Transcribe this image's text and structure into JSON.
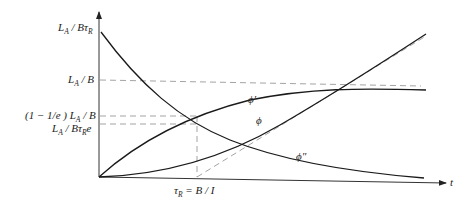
{
  "diagram": {
    "axes": {
      "x_label": "t",
      "y_label": ""
    },
    "y_labels": {
      "top": {
        "main": "L",
        "sub": "A",
        "rest": " / Bτ",
        "sub2": "R"
      },
      "la_b": {
        "main": "L",
        "sub": "A",
        "rest": " / B"
      },
      "one_minus": {
        "prefix": "(1 − 1/e ) L",
        "sub": "A",
        "rest": " / B"
      },
      "la_btre": {
        "main": "L",
        "sub": "A",
        "rest": " / Bτ",
        "sub2": "R",
        "tail": "e"
      }
    },
    "x_labels": {
      "tau": {
        "main": "τ",
        "sub": "R",
        "rest": " = B / I"
      }
    },
    "curves": [
      {
        "name": "phi-prime",
        "label": "ϕ′"
      },
      {
        "name": "phi",
        "label": "ϕ"
      },
      {
        "name": "phi-double-prime",
        "label": "ϕ″"
      }
    ]
  }
}
